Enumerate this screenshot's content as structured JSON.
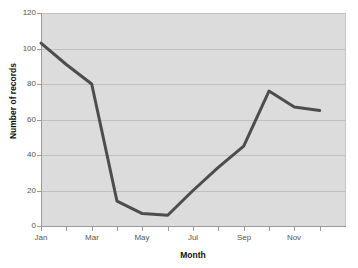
{
  "chart_data": {
    "type": "line",
    "title": "",
    "xlabel": "Month",
    "ylabel": "Number of records",
    "categories": [
      "Jan",
      "Feb",
      "Mar",
      "Apr",
      "May",
      "Jun",
      "Jul",
      "Aug",
      "Sep",
      "Oct",
      "Nov",
      "Dec"
    ],
    "values": [
      103,
      91,
      80,
      14,
      7,
      6,
      20,
      33,
      45,
      76,
      67,
      65
    ],
    "series": [
      {
        "name": "Number of records",
        "values": [
          103,
          91,
          80,
          14,
          7,
          6,
          20,
          33,
          45,
          76,
          67,
          65
        ]
      }
    ],
    "ylim": [
      0,
      120
    ],
    "ytick_labels": [
      "0",
      "20",
      "40",
      "60",
      "80",
      "100",
      "120"
    ],
    "ytick_values": [
      0,
      20,
      40,
      60,
      80,
      100,
      120
    ],
    "xtick_labels": [
      "Jan",
      "Mar",
      "May",
      "Jul",
      "Sep",
      "Nov"
    ],
    "xtick_values": [
      1,
      3,
      5,
      7,
      9,
      11
    ],
    "minor_xtick_labels": [
      "Feb",
      "Apr",
      "Jun",
      "Aug",
      "Oct",
      "Dec"
    ],
    "grid": true,
    "grid_axis": "y",
    "legend": false,
    "legend_position": "none",
    "plot_background": "#dcdcdc",
    "figure_background": "#ffffff",
    "line_color": "#4d4d4d",
    "gridline_color": "#c0c0c0",
    "axis_color": "#9a9a9a",
    "line_width": 3,
    "markers": false
  }
}
